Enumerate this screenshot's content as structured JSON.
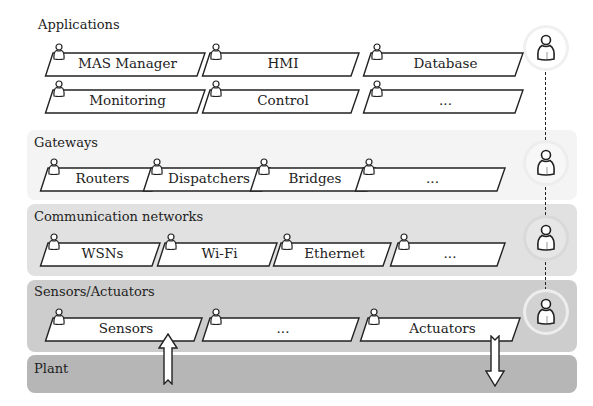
{
  "colors": {
    "applications_band": "#ffffff",
    "gateways_band": "#f4f4f4",
    "communication_band": "#e1e1e1",
    "sensors_band": "#cdcdcd",
    "plant_band": "#b9b9b9",
    "outline": "#222222",
    "box_fill": "#ffffff"
  },
  "layers": {
    "applications": {
      "label": "Applications",
      "items": [
        "MAS Manager",
        "HMI",
        "Database",
        "Monitoring",
        "Control",
        "..."
      ]
    },
    "gateways": {
      "label": "Gateways",
      "items": [
        "Routers",
        "Dispatchers",
        "Bridges",
        "..."
      ]
    },
    "communication": {
      "label": "Communication networks",
      "items": [
        "WSNs",
        "Wi-Fi",
        "Ethernet",
        "..."
      ]
    },
    "sensors": {
      "label": "Sensors/Actuators",
      "items": [
        "Sensors",
        "...",
        "Actuators"
      ]
    },
    "plant": {
      "label": "Plant"
    }
  },
  "icons": {
    "agent": "person-agent-icon",
    "up_arrow": "up-arrow-icon",
    "down_arrow": "down-arrow-icon"
  }
}
